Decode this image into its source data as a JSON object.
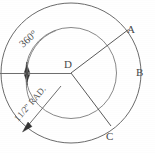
{
  "figure": {
    "type": "geometric-technical-drawing",
    "background_color": "#ffffff",
    "line_color": "#5a5a5a"
  },
  "labels": {
    "point_a": "A",
    "point_b": "B",
    "point_c": "C",
    "center_d": "D"
  },
  "annotations": {
    "angle_label": "360°",
    "radius_label_whole": "1",
    "radius_label_fraction": "1/2",
    "radius_label_unit": "\" RAD."
  },
  "geometry": {
    "center": {
      "x": 71,
      "y": 73
    },
    "outer_circle_radius": 70,
    "inner_circle_radius": 45,
    "point_a": {
      "x": 128,
      "y": 30
    },
    "point_b": {
      "x": 138,
      "y": 72
    },
    "point_c": {
      "x": 111,
      "y": 126
    },
    "dimension_tick_x": 27,
    "dimension_line_y": 73
  }
}
